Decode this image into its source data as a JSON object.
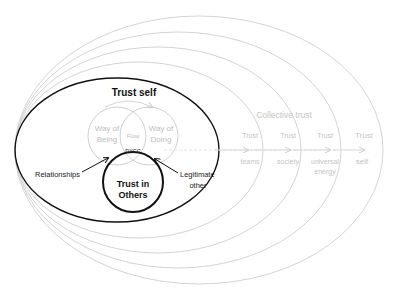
{
  "diagram": {
    "inner_title": "Trust self",
    "venn": {
      "left": [
        "Way of",
        "Being"
      ],
      "right": [
        "Way of",
        "Doing"
      ],
      "center": "Flow",
      "core": "DYCC"
    },
    "trust_in_others": [
      "Trust in",
      "Others"
    ],
    "relationships": "Relationships",
    "legitimate_other": [
      "Legitimate",
      "other"
    ],
    "collective_trust": "Collective trust",
    "rings": [
      {
        "top": "Trust",
        "bottom": [
          "teams"
        ]
      },
      {
        "top": "Trust",
        "bottom": [
          "society"
        ]
      },
      {
        "top": "Trust",
        "bottom": [
          "universal",
          "energy"
        ]
      },
      {
        "top": "Trust",
        "bottom": [
          "self"
        ]
      }
    ]
  },
  "colors": {
    "bold_stroke": "#111111",
    "faint_stroke": "#cfcfcf",
    "faint_text": "#c4c4c4"
  }
}
